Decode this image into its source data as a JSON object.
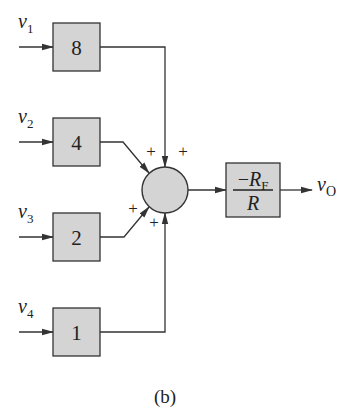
{
  "diagram": {
    "type": "block-diagram",
    "inputs": [
      {
        "var": "v",
        "sub": "1",
        "gain": "8"
      },
      {
        "var": "v",
        "sub": "2",
        "gain": "4"
      },
      {
        "var": "v",
        "sub": "3",
        "gain": "2"
      },
      {
        "var": "v",
        "sub": "4",
        "gain": "1"
      }
    ],
    "summing_junction": {
      "signs": [
        "+",
        "+",
        "+",
        "+"
      ]
    },
    "gain_block": {
      "numerator_sign": "−",
      "numerator_var": "R",
      "numerator_sub": "F",
      "denominator": "R"
    },
    "output": {
      "var": "v",
      "sub": "O"
    },
    "caption": "(b)"
  },
  "colors": {
    "block_fill": "#d4d4d4",
    "stroke": "#333333",
    "background": "#ffffff"
  }
}
